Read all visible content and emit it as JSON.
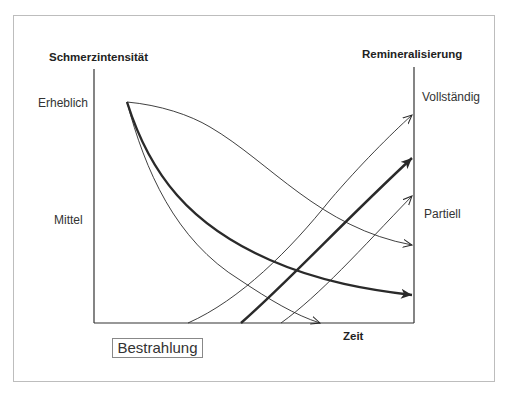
{
  "diagram": {
    "left_axis_title": "Schmerzintensität",
    "right_axis_title": "Remineralisierung",
    "x_axis_title": "Zeit",
    "left_ticks": {
      "high": "Erheblich",
      "mid": "Mittel"
    },
    "right_ticks": {
      "high": "Vollständig",
      "mid": "Partiell"
    },
    "treatment_label": "Bestrahlung",
    "line_color": "#2a2a2a",
    "pain_curves": [
      {
        "name": "slow-decline",
        "weight": "thin",
        "end": "upper-right"
      },
      {
        "name": "average-decline",
        "weight": "thick",
        "end": "lower-right"
      },
      {
        "name": "fast-decline",
        "weight": "thin",
        "end": "baseline"
      }
    ],
    "remineralization_curves": [
      {
        "name": "early",
        "weight": "thin",
        "target": "Vollständig"
      },
      {
        "name": "average",
        "weight": "thick",
        "target": "between"
      },
      {
        "name": "late",
        "weight": "thin",
        "target": "Partiell"
      }
    ]
  }
}
